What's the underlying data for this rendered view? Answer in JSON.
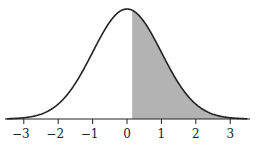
{
  "chart_data": {
    "type": "area",
    "title": "",
    "xlabel": "",
    "ylabel": "",
    "distribution": {
      "name": "standard normal",
      "mean": 0,
      "sd": 1
    },
    "shaded_region": {
      "from": 0.15,
      "to": "infinity"
    },
    "xlim": [
      -3.5,
      3.5
    ],
    "x_ticks": [
      -3,
      -2,
      -1,
      0,
      1,
      2,
      3
    ],
    "x_tick_labels": [
      "−3",
      "−2",
      "−1",
      "0",
      "1",
      "2",
      "3"
    ],
    "grid": false,
    "colors": {
      "curve": "#222222",
      "shade": "#b3b3b3",
      "axis": "#222222"
    }
  }
}
